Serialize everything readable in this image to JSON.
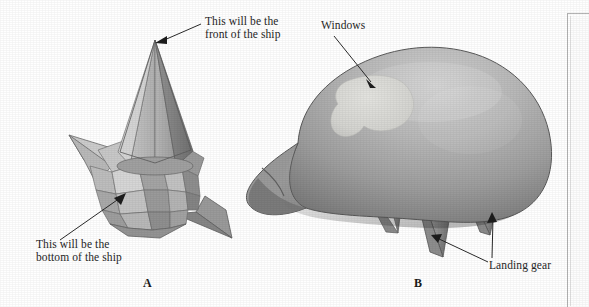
{
  "figure": {
    "caption_a": "A",
    "caption_b": "B",
    "panel_a": {
      "label_front": "This will be the\nfront of the ship",
      "label_front_line1": "This will be the",
      "label_front_line2": "front of the ship",
      "label_bottom_line1": "This will be the",
      "label_bottom_line2": "bottom of the ship",
      "object": "star-cone-ship-blank",
      "description": "Faceted low-polygon star shape with tall cone at top"
    },
    "panel_b": {
      "label_windows": "Windows",
      "label_landing_gear": "Landing gear",
      "object": "smooth-shaded-ship",
      "description": "Smooth shaded rounded spaceship hull with three conical landing gear legs and a light window patch"
    }
  },
  "colors": {
    "page_background": "#ffffff",
    "ink": "#262626",
    "mid_gray": "#a8a8a8",
    "light_gray": "#c9c9c9",
    "lighter_gray": "#d8d8d8",
    "dark_gray": "#6e6e6e",
    "darker_gray": "#585858",
    "windows_patch": "#d6d6d2",
    "outline": "#4a4a4a",
    "panel_border": "#b4b4b4"
  }
}
